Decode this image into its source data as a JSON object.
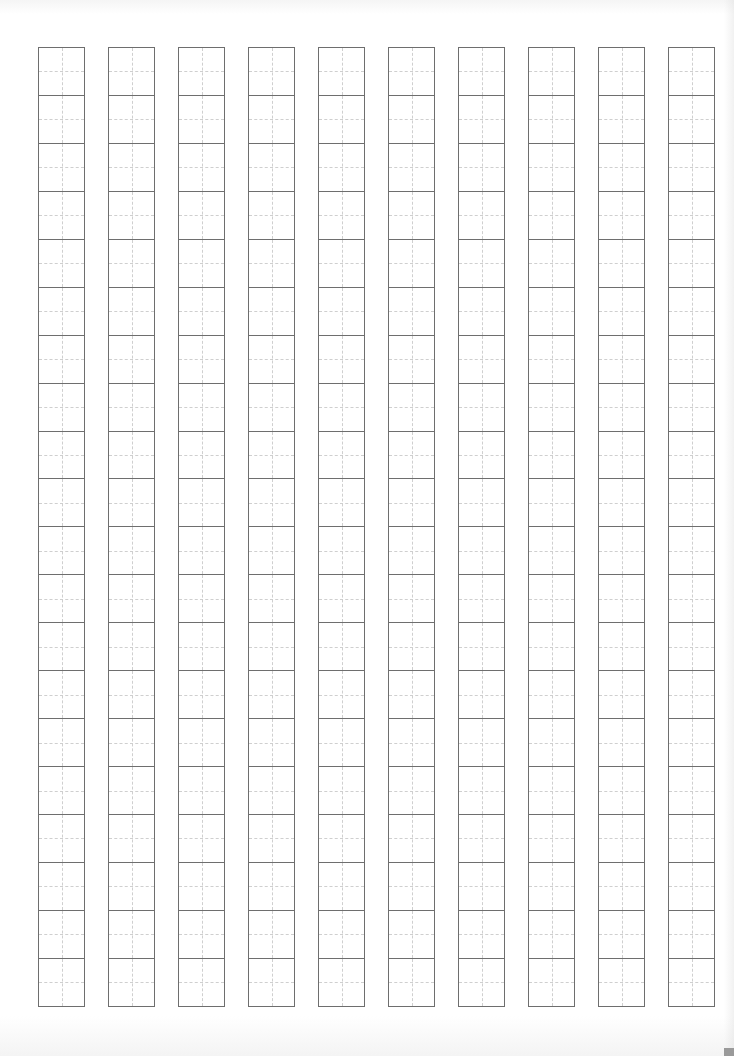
{
  "sheet": {
    "type": "tianzige-practice-grid",
    "columns": 10,
    "rows_per_column": 20,
    "column_lefts": [
      38,
      108,
      178,
      248,
      318,
      388,
      458,
      528,
      598,
      668
    ],
    "column_top": 47,
    "column_width": 47,
    "cell_height": 47.95,
    "border_color": "#6e6e6e",
    "guide_color": "#cfcfcf",
    "background": "#ffffff"
  }
}
